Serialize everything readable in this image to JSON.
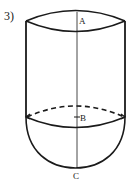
{
  "problem_number": "3)",
  "points": {
    "a": "A",
    "b": "B",
    "c": "C"
  },
  "figure": {
    "stroke_color": "#1a1a1a"
  }
}
